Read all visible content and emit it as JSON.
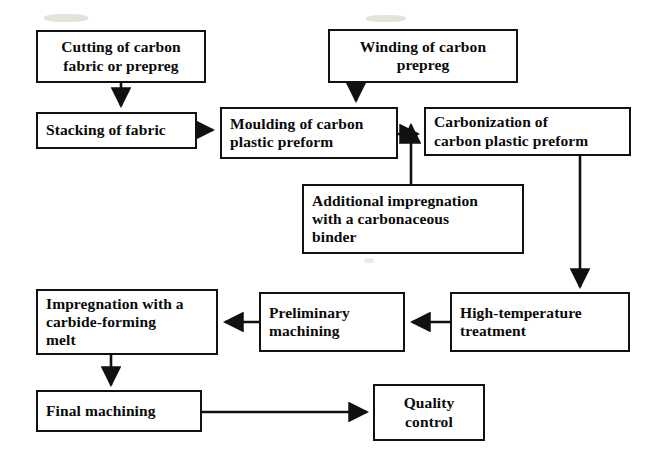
{
  "diagram": {
    "background_color": "#ffffff",
    "line_color": "#111111",
    "text_color": "#0a0a0a",
    "width": 655,
    "height": 470
  },
  "nodes": [
    {
      "id": "cutting",
      "label": "Cutting of carbon\nfabric or prepreg",
      "x": 36,
      "y": 30,
      "w": 170,
      "h": 53
    },
    {
      "id": "winding",
      "label": "Winding of carbon\nprepreg",
      "x": 328,
      "y": 29,
      "w": 190,
      "h": 54
    },
    {
      "id": "stacking",
      "label": "Stacking of fabric",
      "x": 36,
      "y": 112,
      "w": 161,
      "h": 37
    },
    {
      "id": "moulding",
      "label": "Moulding of carbon\nplastic preform",
      "x": 220,
      "y": 107,
      "w": 178,
      "h": 52
    },
    {
      "id": "carbonization",
      "label": "Carbonization of\ncarbon plastic preform",
      "x": 424,
      "y": 107,
      "w": 207,
      "h": 49
    },
    {
      "id": "additional-impregnation",
      "label": "Additional impregnation\nwith a carbonaceous\nbinder",
      "x": 302,
      "y": 184,
      "w": 222,
      "h": 70
    },
    {
      "id": "carbide-impregnation",
      "label": "Impregnation with a\ncarbide-forming\nmelt",
      "x": 36,
      "y": 289,
      "w": 182,
      "h": 66
    },
    {
      "id": "preliminary-machining",
      "label": "Preliminary\nmachining",
      "x": 259,
      "y": 292,
      "w": 146,
      "h": 60
    },
    {
      "id": "high-temperature",
      "label": "High-temperature\ntreatment",
      "x": 450,
      "y": 292,
      "w": 180,
      "h": 60
    },
    {
      "id": "final-machining",
      "label": "Final machining",
      "x": 36,
      "y": 390,
      "w": 166,
      "h": 42
    },
    {
      "id": "quality-control",
      "label": "Quality\ncontrol",
      "x": 373,
      "y": 384,
      "w": 112,
      "h": 57
    }
  ],
  "edges": [
    {
      "id": "cutting-to-stacking",
      "from": "cutting",
      "to": "stacking",
      "direction": "down"
    },
    {
      "id": "stacking-to-moulding",
      "from": "stacking",
      "to": "moulding",
      "direction": "right"
    },
    {
      "id": "winding-to-moulding",
      "from": "winding",
      "to": "moulding",
      "direction": "down"
    },
    {
      "id": "moulding-to-carbonization",
      "from": "moulding",
      "to": "carbonization",
      "direction": "right"
    },
    {
      "id": "additional-impregnation-to-moulding",
      "from": "additional-impregnation",
      "to": "moulding",
      "direction": "up"
    },
    {
      "id": "carbonization-to-high-temperature",
      "from": "carbonization",
      "to": "high-temperature",
      "direction": "down"
    },
    {
      "id": "high-temperature-to-preliminary-machining",
      "from": "high-temperature",
      "to": "preliminary-machining",
      "direction": "left"
    },
    {
      "id": "preliminary-machining-to-carbide-impregnation",
      "from": "preliminary-machining",
      "to": "carbide-impregnation",
      "direction": "left"
    },
    {
      "id": "carbide-impregnation-to-final-machining",
      "from": "carbide-impregnation",
      "to": "final-machining",
      "direction": "down"
    },
    {
      "id": "final-machining-to-quality-control",
      "from": "final-machining",
      "to": "quality-control",
      "direction": "right"
    }
  ]
}
